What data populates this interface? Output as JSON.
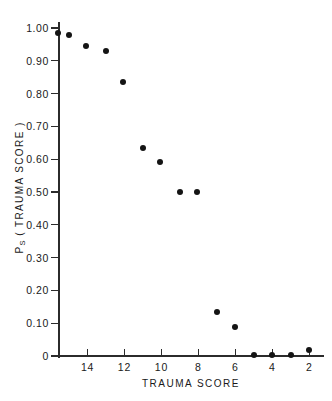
{
  "chart_data": {
    "type": "scatter",
    "title": "",
    "xlabel": "TRAUMA SCORE",
    "ylabel": "Ps (TRAUMA SCORE)",
    "ylabel_base": "P",
    "ylabel_sub": "S",
    "ylabel_rest": " ( TRAUMA SCORE )",
    "xlim": [
      15.6,
      1.2
    ],
    "ylim": [
      0,
      1.0
    ],
    "x_reversed": true,
    "grid": false,
    "legend": null,
    "xticks": [
      14,
      12,
      10,
      8,
      6,
      4,
      2
    ],
    "xtick_labels": [
      "14",
      "12",
      "10",
      "8",
      "6",
      "4",
      "2"
    ],
    "yticks": [
      0,
      0.1,
      0.2,
      0.3,
      0.4,
      0.5,
      0.6,
      0.7,
      0.8,
      0.9,
      1.0
    ],
    "ytick_labels": [
      "0",
      "0.10",
      "0.20",
      "0.30",
      "0.40",
      "0.50",
      "0.60",
      "0.70",
      "0.80",
      "0.90",
      "1.00"
    ],
    "marker": "filled-circle",
    "marker_color": "#141414",
    "x": [
      15.6,
      15.0,
      14.1,
      13.0,
      12.1,
      11.0,
      10.1,
      9.0,
      8.1,
      7.0,
      6.0,
      5.0,
      4.0,
      3.0,
      2.0
    ],
    "y": [
      0.985,
      0.98,
      0.945,
      0.93,
      0.835,
      0.635,
      0.59,
      0.5,
      0.5,
      0.135,
      0.088,
      0.003,
      0.003,
      0.003,
      0.018
    ],
    "points": [
      {
        "x": 15.6,
        "y": 0.985
      },
      {
        "x": 15.0,
        "y": 0.98
      },
      {
        "x": 14.1,
        "y": 0.945
      },
      {
        "x": 13.0,
        "y": 0.93
      },
      {
        "x": 12.1,
        "y": 0.835
      },
      {
        "x": 11.0,
        "y": 0.635
      },
      {
        "x": 10.1,
        "y": 0.59
      },
      {
        "x": 9.0,
        "y": 0.5
      },
      {
        "x": 8.1,
        "y": 0.5
      },
      {
        "x": 7.0,
        "y": 0.135
      },
      {
        "x": 6.0,
        "y": 0.088
      },
      {
        "x": 5.0,
        "y": 0.003
      },
      {
        "x": 4.0,
        "y": 0.003
      },
      {
        "x": 3.0,
        "y": 0.003
      },
      {
        "x": 2.0,
        "y": 0.018
      }
    ]
  }
}
